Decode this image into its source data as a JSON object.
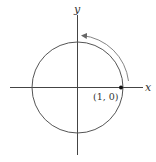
{
  "diagram": {
    "type": "unit-circle",
    "axes": {
      "x_label": "x",
      "y_label": "y"
    },
    "circle": {
      "center": [
        0,
        0
      ],
      "radius": 1
    },
    "point": {
      "label": "(1, 0)",
      "coords": [
        1,
        0
      ]
    },
    "arrow": {
      "direction": "counterclockwise",
      "from": "(1, 0)",
      "toward": "positive y-axis"
    },
    "colors": {
      "stroke": "#444444",
      "background": "#ffffff"
    }
  }
}
